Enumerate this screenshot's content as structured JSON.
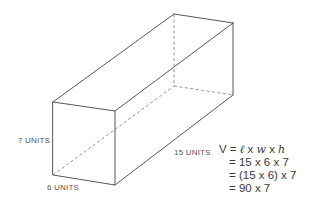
{
  "diagram": {
    "type": "rectangular-prism",
    "colors": {
      "edge": "#444444",
      "hidden_edge": "#777777",
      "text": "#3a3a3a",
      "label": "#555555"
    },
    "vertices": {
      "front_top_left": [
        53,
        102
      ],
      "front_top_right": [
        115,
        111
      ],
      "front_bottom_right": [
        115,
        185
      ],
      "front_bottom_left": [
        53,
        175
      ],
      "back_top_left": [
        174,
        14
      ],
      "back_top_right": [
        233,
        23
      ],
      "back_bottom_right": [
        233,
        95
      ],
      "back_bottom_left": [
        174,
        86
      ]
    },
    "labels": {
      "height": "7 UNITS",
      "width": "6 UNITS",
      "length": "15 UNITS"
    }
  },
  "formula": {
    "line1_prefix": "V = ",
    "line1_l": "ℓ",
    "line1_x1": " x ",
    "line1_w": "w",
    "line1_x2": " x ",
    "line1_h": "h",
    "line2": "= 15 x 6 x 7",
    "line3": "= (15 x 6) x 7",
    "line4": "= 90 x 7"
  }
}
